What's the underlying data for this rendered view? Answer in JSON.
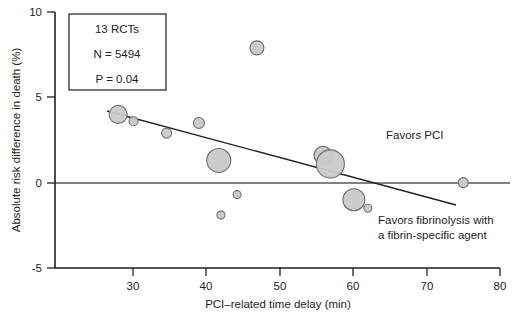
{
  "chart_data": {
    "type": "scatter",
    "title": "",
    "xlabel": "PCI–related time delay (min)",
    "ylabel": "Absolute risk difference in death (%)",
    "xlim": [
      19.4,
      80
    ],
    "ylim": [
      -5,
      10
    ],
    "xticks": [
      30,
      40,
      50,
      60,
      70,
      80
    ],
    "xticklabels": [
      "30",
      "40",
      "50",
      "60",
      "70",
      "80"
    ],
    "yticks": [
      10,
      5,
      0,
      -5
    ],
    "yticklabels": [
      "10",
      "5",
      "0",
      "-5"
    ],
    "grid": false,
    "legend": "none",
    "zero_reference_line": 0,
    "points": [
      {
        "x": 28.0,
        "y": 4.0,
        "size": 9.0
      },
      {
        "x": 30.1,
        "y": 3.6,
        "size": 4.5
      },
      {
        "x": 34.6,
        "y": 2.9,
        "size": 5.0
      },
      {
        "x": 39.0,
        "y": 3.5,
        "size": 5.5
      },
      {
        "x": 41.7,
        "y": 1.3,
        "size": 12.0
      },
      {
        "x": 46.9,
        "y": 7.9,
        "size": 7.0
      },
      {
        "x": 44.2,
        "y": -0.7,
        "size": 4.0
      },
      {
        "x": 42.0,
        "y": -1.9,
        "size": 4.0
      },
      {
        "x": 55.9,
        "y": 1.6,
        "size": 9.0
      },
      {
        "x": 56.9,
        "y": 1.1,
        "size": 14.0
      },
      {
        "x": 60.1,
        "y": -1.0,
        "size": 11.0
      },
      {
        "x": 62.0,
        "y": -1.5,
        "size": 4.0
      },
      {
        "x": 75.0,
        "y": 0.0,
        "size": 5.0
      }
    ],
    "regression_line": {
      "x1": 26.5,
      "y1": 4.2,
      "x2": 74.0,
      "y2": -1.3
    },
    "annotations": [
      {
        "id": "favors-pci",
        "text": "Favors PCI",
        "x": 64.0,
        "y": 2.6
      },
      {
        "id": "favors-fibrinolysis-1",
        "text": "Favors fibrinolysis with",
        "x": 63.0,
        "y": -2.3
      },
      {
        "id": "favors-fibrinolysis-2",
        "text": "a fibrin-specific agent",
        "x": 63.0,
        "y": -3.1
      }
    ],
    "stats_box": {
      "lines": [
        "13 RCTs",
        "N = 5494",
        "P = 0.04"
      ]
    },
    "colors": {
      "bubble_fill": "#c9c9c9",
      "bubble_stroke": "#6d6e71",
      "axis": "#231f20",
      "zero_line": "#58595b"
    }
  }
}
